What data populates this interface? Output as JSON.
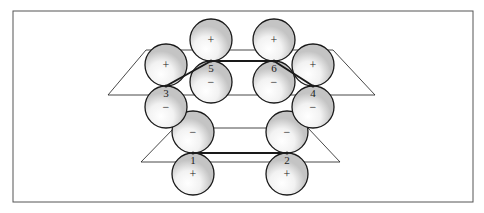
{
  "diagram": {
    "colors": {
      "line": "#1a1a1a",
      "shade": "#c8c8c8",
      "frame": "#555555",
      "background": "#ffffff"
    },
    "planes": [
      {
        "name": "upper-plane",
        "top": [
          [
            146,
            50
          ],
          [
            333,
            50
          ]
        ],
        "bottom": [
          [
            108,
            95
          ],
          [
            375,
            95
          ]
        ]
      },
      {
        "name": "lower-plane",
        "top": [
          [
            174,
            128
          ],
          [
            308,
            128
          ]
        ],
        "bottom": [
          [
            141,
            162
          ],
          [
            340,
            162
          ]
        ]
      }
    ],
    "atoms": [
      {
        "id": "1",
        "label": "1",
        "x": 193,
        "y": 153,
        "upper_sign": "−",
        "lower_sign": "+"
      },
      {
        "id": "2",
        "label": "2",
        "x": 287,
        "y": 153,
        "upper_sign": "−",
        "lower_sign": "+"
      },
      {
        "id": "3",
        "label": "3",
        "x": 166,
        "y": 86,
        "upper_sign": "+",
        "lower_sign": "−"
      },
      {
        "id": "4",
        "label": "4",
        "x": 313,
        "y": 86,
        "upper_sign": "+",
        "lower_sign": "−"
      },
      {
        "id": "5",
        "label": "5",
        "x": 211,
        "y": 61,
        "upper_sign": "+",
        "lower_sign": "−"
      },
      {
        "id": "6",
        "label": "6",
        "x": 274,
        "y": 61,
        "upper_sign": "+",
        "lower_sign": "−"
      }
    ],
    "bonds": [
      [
        "1",
        "2"
      ],
      [
        "3",
        "5"
      ],
      [
        "5",
        "6"
      ],
      [
        "6",
        "4"
      ]
    ]
  }
}
